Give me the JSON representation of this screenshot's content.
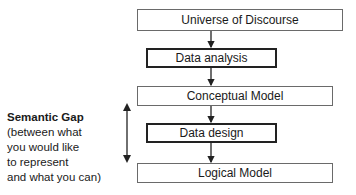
{
  "diagram": {
    "nodes": [
      {
        "id": "universe",
        "label": "Universe of Discourse",
        "style": "thin"
      },
      {
        "id": "analysis",
        "label": "Data analysis",
        "style": "thick"
      },
      {
        "id": "conceptual",
        "label": "Conceptual Model",
        "style": "thin"
      },
      {
        "id": "design",
        "label": "Data design",
        "style": "thick"
      },
      {
        "id": "logical",
        "label": "Logical Model",
        "style": "thin"
      }
    ],
    "edges": [
      {
        "from": "universe",
        "to": "analysis"
      },
      {
        "from": "analysis",
        "to": "conceptual"
      },
      {
        "from": "conceptual",
        "to": "design"
      },
      {
        "from": "design",
        "to": "logical"
      }
    ],
    "semantic_gap": {
      "title": "Semantic Gap",
      "lines": [
        "(between what",
        "you would like",
        "to represent",
        "and what you can)"
      ],
      "spans": [
        "conceptual",
        "logical"
      ]
    }
  }
}
